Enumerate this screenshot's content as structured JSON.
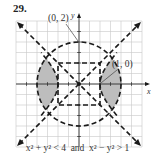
{
  "problem_number": "29.",
  "caption": {
    "ineq1": "x² + y² < 4",
    "and": "and",
    "ineq2": "x² − y² > 1"
  },
  "axes": {
    "x_label": "x",
    "y_label": "y",
    "range": [
      -3,
      3
    ],
    "grid_step": 0.5
  },
  "annotations": [
    {
      "label": "(0, 2)",
      "point": [
        0,
        2
      ]
    },
    {
      "label": "(1, 0)",
      "point": [
        1,
        0
      ]
    }
  ],
  "curves": [
    {
      "name": "circle",
      "equation": "x² + y² = 4",
      "style": "dashed"
    },
    {
      "name": "hyperbola",
      "equation": "x² − y² = 1",
      "style": "dashed"
    },
    {
      "name": "asymptotes",
      "equation": "y = ±x",
      "style": "dashed"
    },
    {
      "name": "construction-box",
      "equation": "|x| = 1, |y| = 1",
      "style": "dashed"
    }
  ],
  "shaded_region": "between hyperbola branches and circle",
  "colors": {
    "grid": "#c8c8c8",
    "ink": "#1a1a1a",
    "shade": "#bdbdbd"
  }
}
